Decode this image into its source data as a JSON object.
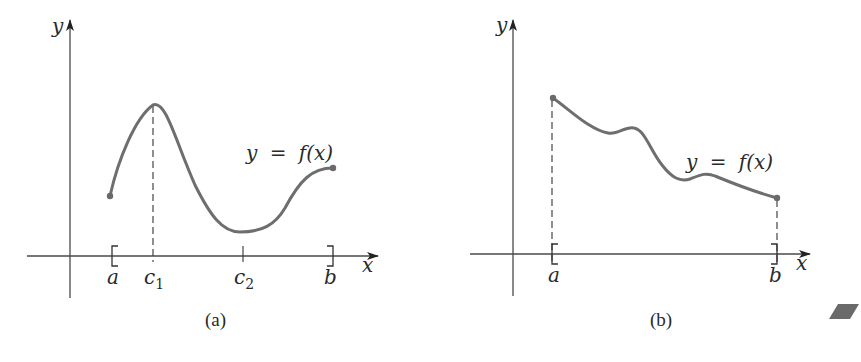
{
  "figures": [
    {
      "id": "a",
      "caption": "(a)",
      "y_axis_label": "y",
      "x_axis_label": "x",
      "curve_label": "y = f(x)",
      "curve_label_parts": {
        "lhs": "y",
        "eq": "=",
        "rhs": "f(x)"
      },
      "interval": {
        "left_bracket": "[",
        "right_bracket": "]"
      },
      "x_ticks": [
        {
          "label": "a",
          "sub": ""
        },
        {
          "label": "c",
          "sub": "1"
        },
        {
          "label": "c",
          "sub": "2"
        },
        {
          "label": "b",
          "sub": ""
        }
      ],
      "annotations": [
        "dashed vertical line from c1 to maximum",
        "tick at c2 below minimum"
      ]
    },
    {
      "id": "b",
      "caption": "(b)",
      "y_axis_label": "y",
      "x_axis_label": "x",
      "curve_label": "y = f(x)",
      "curve_label_parts": {
        "lhs": "y",
        "eq": "=",
        "rhs": "f(x)"
      },
      "interval": {
        "left_bracket": "[",
        "right_bracket": "]"
      },
      "x_ticks": [
        {
          "label": "a",
          "sub": ""
        },
        {
          "label": "b",
          "sub": ""
        }
      ],
      "annotations": [
        "dashed vertical line at a up to maximum",
        "dashed vertical line at b up to minimum"
      ]
    }
  ],
  "colors": {
    "axis": "#4a4a4a",
    "curve": "#6e6e6e",
    "text": "#2a2a2a",
    "marker": "#6a6a6a"
  }
}
